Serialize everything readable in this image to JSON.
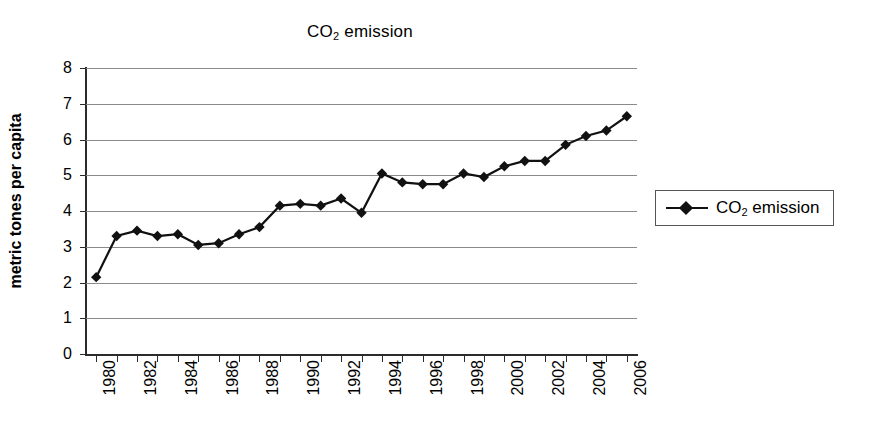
{
  "chart_data": {
    "type": "line",
    "title": "CO2 emission",
    "title_parts": {
      "prefix": "CO",
      "sub": "2",
      "suffix": " emission"
    },
    "xlabel": "",
    "ylabel": "metric tones per capita",
    "ylim": [
      0,
      8
    ],
    "ytick_labels": [
      "8",
      "7",
      "6",
      "5",
      "4",
      "3",
      "2",
      "1",
      "0"
    ],
    "ytick_values": [
      8,
      7,
      6,
      5,
      4,
      3,
      2,
      1,
      0
    ],
    "grid": "horizontal",
    "legend_position": "right",
    "legend_entries": [
      "CO2 emission"
    ],
    "marker": "diamond",
    "line_color": "#111111",
    "marker_color": "#111111",
    "grid_color": "#8a8a8a",
    "axis_color": "#2b2b2b",
    "x": [
      1980,
      1981,
      1982,
      1983,
      1984,
      1985,
      1986,
      1987,
      1988,
      1989,
      1990,
      1991,
      1992,
      1993,
      1994,
      1995,
      1996,
      1997,
      1998,
      1999,
      2000,
      2001,
      2002,
      2003,
      2004,
      2005,
      2006
    ],
    "xtick_labels": [
      "1980",
      "1982",
      "1984",
      "1986",
      "1988",
      "1990",
      "1992",
      "1994",
      "1996",
      "1998",
      "2000",
      "2002",
      "2004",
      "2006"
    ],
    "xtick_values": [
      1980,
      1982,
      1984,
      1986,
      1988,
      1990,
      1992,
      1994,
      1996,
      1998,
      2000,
      2002,
      2004,
      2006
    ],
    "series": [
      {
        "name": "CO2 emission",
        "name_parts": {
          "prefix": "CO",
          "sub": "2",
          "suffix": " emission"
        },
        "values": [
          2.15,
          3.3,
          3.45,
          3.3,
          3.35,
          3.05,
          3.1,
          3.35,
          3.55,
          4.15,
          4.2,
          4.15,
          4.35,
          3.95,
          5.05,
          4.8,
          4.75,
          4.75,
          5.05,
          4.95,
          5.25,
          5.4,
          5.4,
          5.85,
          6.1,
          6.25,
          6.65
        ]
      }
    ]
  }
}
